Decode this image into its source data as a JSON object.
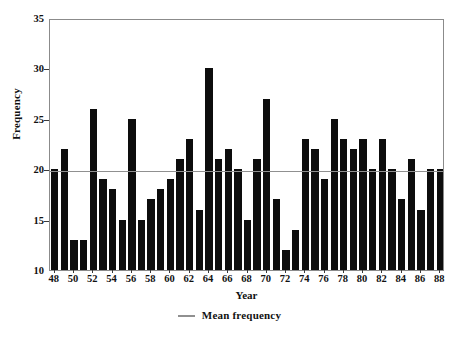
{
  "chart_data": {
    "type": "bar",
    "title": "",
    "xlabel": "Year",
    "ylabel": "Frequency",
    "ylim": [
      10,
      35
    ],
    "y_ticks": [
      10,
      15,
      20,
      25,
      30,
      35
    ],
    "xlim": [
      47.5,
      88.5
    ],
    "x_ticks": [
      48,
      50,
      52,
      54,
      56,
      58,
      60,
      62,
      64,
      66,
      68,
      70,
      72,
      74,
      76,
      78,
      80,
      82,
      84,
      86,
      88
    ],
    "grid": false,
    "legend_position": "bottom-center",
    "legend": [
      {
        "label": "Mean frequency",
        "marker": "line",
        "color": "#909090"
      }
    ],
    "annotations": [
      {
        "name": "mean-frequency-line",
        "type": "hline",
        "value": 20,
        "color": "#909090"
      }
    ],
    "bar_color": "#0d0d0d",
    "categories": [
      48,
      49,
      50,
      51,
      52,
      53,
      54,
      55,
      56,
      57,
      58,
      59,
      60,
      61,
      62,
      63,
      64,
      65,
      66,
      67,
      68,
      69,
      70,
      71,
      72,
      73,
      74,
      75,
      76,
      77,
      78,
      79,
      80,
      81,
      82,
      83,
      84,
      85,
      86,
      87,
      88
    ],
    "values": [
      20,
      22,
      13,
      13,
      26,
      19,
      18,
      15,
      25,
      15,
      17,
      18,
      19,
      21,
      23,
      16,
      30,
      21,
      22,
      20,
      15,
      21,
      27,
      17,
      12,
      14,
      23,
      22,
      19,
      25,
      23,
      22,
      23,
      20,
      23,
      20,
      17,
      21,
      16,
      20,
      20
    ],
    "series": [
      {
        "name": "Frequency",
        "values": [
          20,
          22,
          13,
          13,
          26,
          19,
          18,
          15,
          25,
          15,
          17,
          18,
          19,
          21,
          23,
          16,
          30,
          21,
          22,
          20,
          15,
          21,
          27,
          17,
          12,
          14,
          23,
          22,
          19,
          25,
          23,
          22,
          23,
          20,
          23,
          20,
          17,
          21,
          16,
          20,
          20
        ]
      }
    ]
  }
}
